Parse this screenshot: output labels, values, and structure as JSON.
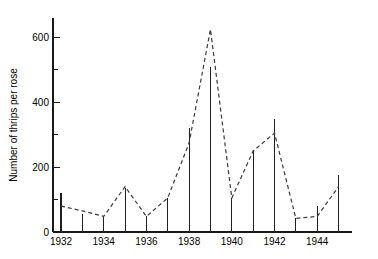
{
  "chart_data": {
    "type": "line",
    "title": "",
    "subtitle": "",
    "xlabel": "",
    "ylabel": "Number of thrips per rose",
    "xlim": [
      1931.5,
      1945.5
    ],
    "ylim": [
      0,
      660
    ],
    "grid": false,
    "legend": null,
    "y_ticks_major": [
      0,
      200,
      400,
      600
    ],
    "y_ticks_minor": [
      100,
      300,
      500
    ],
    "y_tick_labels": [
      "0",
      "200",
      "400",
      "600"
    ],
    "x_ticks": [
      1932,
      1933,
      1934,
      1935,
      1936,
      1937,
      1938,
      1939,
      1940,
      1941,
      1942,
      1943,
      1944,
      1945
    ],
    "x_tick_labels_shown": [
      "1932",
      "1934",
      "1936",
      "1938",
      "1940",
      "1942",
      "1944"
    ],
    "x_labeled_years": [
      1932,
      1934,
      1936,
      1938,
      1940,
      1942,
      1944
    ],
    "x": [
      1932,
      1933,
      1934,
      1935,
      1936,
      1937,
      1938,
      1939,
      1940,
      1941,
      1942,
      1943,
      1944,
      1945
    ],
    "series": [
      {
        "name": "mean thrips per rose",
        "style": "dashed-line",
        "values": [
          80,
          65,
          48,
          140,
          48,
          105,
          275,
          625,
          105,
          250,
          305,
          42,
          48,
          140
        ]
      },
      {
        "name": "bar maximum",
        "style": "vertical-bar",
        "values": [
          120,
          55,
          48,
          135,
          48,
          105,
          320,
          510,
          105,
          250,
          350,
          42,
          80,
          175
        ]
      }
    ],
    "bar_baseline": 0
  },
  "layout": {
    "plot_left": 53,
    "plot_right": 352,
    "plot_top": 18,
    "plot_bottom": 232,
    "year_step_px": 21.35
  }
}
